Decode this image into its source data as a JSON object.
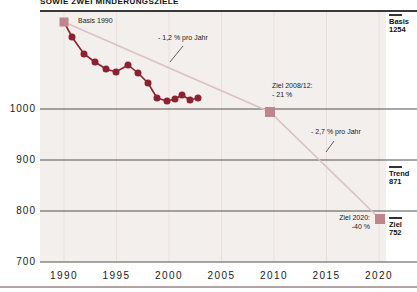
{
  "title": "SOWIE ZWEI MINDERUNGSZIELE",
  "axes": {
    "y_ticks": [
      "1000",
      "900",
      "800",
      "700"
    ],
    "x_ticks": [
      "1990",
      "1995",
      "2000",
      "2005",
      "2010",
      "2015",
      "2020"
    ]
  },
  "annotations": {
    "basis_1990": "Basis 1990",
    "rate_1": "- 1,2 % pro Jahr",
    "ziel_2008": {
      "line1": "Ziel 2008/12:",
      "line2": "- 21 %"
    },
    "rate_2": "- 2,7 % pro Jahr",
    "ziel_2020": {
      "line1": "Ziel 2020:",
      "line2": "-40 %"
    }
  },
  "right_labels": {
    "basis": {
      "name": "Basis",
      "value": "1254"
    },
    "trend": {
      "name": "Trend",
      "value": "871"
    },
    "ziel": {
      "name": "Ziel",
      "value": "752"
    }
  },
  "chart_data": {
    "type": "line",
    "title": "SOWIE ZWEI MINDERUNGSZIELE",
    "x": [
      1990,
      1991,
      1992,
      1993,
      1994,
      1995,
      1996,
      1997,
      1998,
      1999,
      2000,
      2001,
      2002,
      2003,
      2004
    ],
    "series": [
      {
        "name": "emissions-actual",
        "values": [
          1254,
          1195,
          1125,
          1100,
          1085,
          1080,
          1095,
          1070,
          1045,
          1010,
          1000,
          1005,
          1015,
          1000,
          1005
        ]
      }
    ],
    "targets": {
      "basis_1990": 1254,
      "ziel_2008_12_reduction": "- 21 %",
      "ziel_2020_reduction": "-40 %",
      "trend_2020": 871,
      "ziel_2020": 752
    },
    "reduction_rates": [
      "- 1,2 % pro Jahr",
      "- 2,7 % pro Jahr"
    ],
    "xlim": [
      1988,
      2022
    ],
    "ylim": [
      700,
      1260
    ],
    "grid": "horizontal-dark, vertical-light at 5-year ticks",
    "legend": "none"
  },
  "render": {
    "plot": {
      "x": 40,
      "y": 12,
      "w": 346,
      "h": 250
    },
    "h_gridlines_y": [
      109,
      160,
      211,
      262
    ],
    "v_gridlines_x": [
      64,
      116.5,
      169,
      221.5,
      274,
      326.5,
      379
    ],
    "v_grid_top": 12,
    "v_grid_bottom": 262,
    "series_px": [
      [
        64,
        22
      ],
      [
        72,
        37
      ],
      [
        84,
        54
      ],
      [
        95,
        62
      ],
      [
        106,
        69
      ],
      [
        116,
        72
      ],
      [
        128,
        65
      ],
      [
        138,
        73
      ],
      [
        148,
        83
      ],
      [
        157,
        98
      ],
      [
        167,
        101
      ],
      [
        175,
        99
      ],
      [
        182,
        95
      ],
      [
        190,
        100
      ],
      [
        198,
        98
      ]
    ],
    "target_line_px": [
      [
        64,
        22
      ],
      [
        270,
        112
      ],
      [
        380,
        219
      ]
    ],
    "squares_px": [
      [
        64,
        22,
        9
      ],
      [
        270,
        112,
        10
      ],
      [
        380,
        219,
        10
      ]
    ],
    "square_names": [
      "basis-1990-marker",
      "ziel-2008-12-marker",
      "ziel-2020-marker"
    ],
    "pointer_lines_px": [
      [
        [
          183,
          46
        ],
        [
          170,
          62
        ]
      ],
      [
        [
          334,
          141
        ],
        [
          326,
          152
        ]
      ]
    ],
    "colors": {
      "series": "#8e2130",
      "target_line": "#dcc2c5",
      "square": "#bf858c",
      "h_grid": "#55504f",
      "v_grid": "#e8e0dd",
      "pointer": "#3a3a3a",
      "plot_bg": "#f2efec",
      "bottom_rule": "#b3a4a4"
    }
  }
}
